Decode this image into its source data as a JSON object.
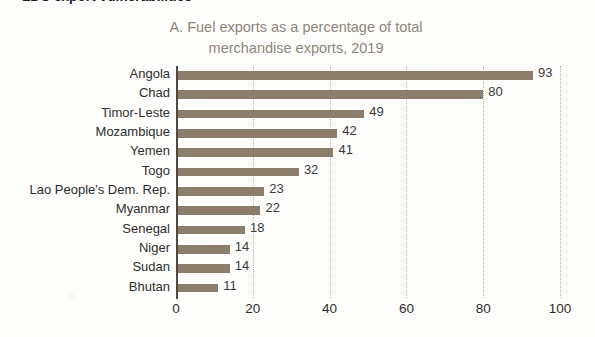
{
  "page": {
    "heading": "LDC export vulnerabilities"
  },
  "chart_data": {
    "type": "bar",
    "orientation": "horizontal",
    "title_line1": "A. Fuel exports as a percentage of total",
    "title_line2": "merchandise exports, 2019",
    "title": "A. Fuel exports as a percentage of total merchandise exports, 2019",
    "xlabel": "",
    "ylabel": "",
    "xlim": [
      0,
      100
    ],
    "xticks": [
      0,
      20,
      40,
      60,
      80,
      100
    ],
    "grid": "vertical-dotted",
    "legend": "none",
    "bar_color": "#8b7e6d",
    "categories": [
      "Angola",
      "Chad",
      "Timor-Leste",
      "Mozambique",
      "Yemen",
      "Togo",
      "Lao People's Dem. Rep.",
      "Myanmar",
      "Senegal",
      "Niger",
      "Sudan",
      "Bhutan"
    ],
    "values": [
      93,
      80,
      49,
      42,
      41,
      32,
      23,
      22,
      18,
      14,
      14,
      11
    ],
    "value_labels": [
      "93",
      "80",
      "49",
      "42",
      "41",
      "32",
      "23",
      "22",
      "18",
      "14",
      "14",
      "11"
    ],
    "xtick_labels": [
      "0",
      "20",
      "40",
      "60",
      "80",
      "100"
    ]
  }
}
